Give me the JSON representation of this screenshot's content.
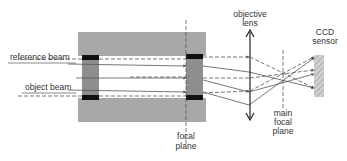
{
  "labels": {
    "reference_beam": "reference beam",
    "object_beam": "object beam",
    "focal_plane_1": "focal",
    "focal_plane_2": "plane",
    "objective_lens_1": "objective",
    "objective_lens_2": "lens",
    "ccd_sensor_1": "CCD",
    "ccd_sensor_2": "sensor",
    "main_focal_1": "main",
    "main_focal_2": "focal",
    "main_focal_3": "plane"
  },
  "colors": {
    "block": "#a8a8a8",
    "inner": "#8e8e8e",
    "cap": "#111111",
    "beam": "#555555",
    "sensor": "#c8c8c8"
  }
}
